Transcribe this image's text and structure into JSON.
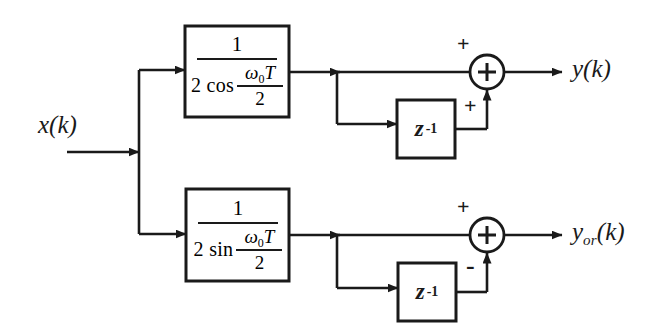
{
  "figure": {
    "kind": "signal-flow-block-diagram",
    "width": 671,
    "height": 336,
    "background_color": "#ffffff",
    "line_color": "#1a1a1a",
    "text_color": "#1a1a1a"
  },
  "input": {
    "label_base": "x",
    "label_arg": "(k)",
    "label_full": "x(k)"
  },
  "paths": {
    "top": {
      "gain_block": {
        "numerator": "1",
        "denominator_trig": "2 cos",
        "denominator_arg_numerator": "ω",
        "denominator_arg_subscript": "0",
        "denominator_arg_symbol": "T",
        "denominator_arg_denominator": "2",
        "expression": "1 / (2 cos (ω₀T/2))"
      },
      "delay_block": {
        "symbol": "z",
        "exponent": "-1",
        "expression": "z⁻¹"
      },
      "summer": {
        "glyph": "+",
        "sign_top": "+",
        "sign_bottom": "+"
      },
      "output": {
        "label_base": "y",
        "label_subscript": "",
        "label_arg": "(k)",
        "label_full": "y(k)"
      }
    },
    "bottom": {
      "gain_block": {
        "numerator": "1",
        "denominator_trig": "2 sin",
        "denominator_arg_numerator": "ω",
        "denominator_arg_subscript": "0",
        "denominator_arg_symbol": "T",
        "denominator_arg_denominator": "2",
        "expression": "1 / (2 sin (ω₀T/2))"
      },
      "delay_block": {
        "symbol": "z",
        "exponent": "-1",
        "expression": "z⁻¹"
      },
      "summer": {
        "glyph": "+",
        "sign_top": "+",
        "sign_bottom": "-"
      },
      "output": {
        "label_base": "y",
        "label_subscript": "or",
        "label_arg": "(k)",
        "label_full": "y_or(k)"
      }
    }
  }
}
